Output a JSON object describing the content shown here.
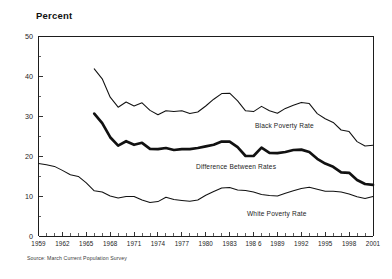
{
  "chart_title": "Percent",
  "source_note": "Source: March Current Population Survey",
  "labels": {
    "black": "Black Poverty Rate",
    "difference": "Difference Between Rates",
    "white": "White Poverty Rate"
  },
  "axis": {
    "y_ticks": [
      "0",
      "10",
      "20",
      "30",
      "40",
      "50"
    ],
    "x_ticks": [
      "1959",
      "1962",
      "1965",
      "1968",
      "1971",
      "1974",
      "1977",
      "1980",
      "198 6",
      "1989",
      "1992",
      "1995",
      "1998",
      "2001"
    ],
    "x_tick_1983": "1983"
  },
  "chart_data": {
    "type": "line",
    "title": "Percent",
    "xlabel": "",
    "ylabel": "Percent",
    "xlim": [
      1959,
      2001
    ],
    "ylim": [
      0,
      50
    ],
    "yticks": [
      0,
      10,
      20,
      30,
      40,
      50
    ],
    "y_minor_tick_step": 5,
    "xticks": [
      1959,
      1962,
      1965,
      1968,
      1971,
      1974,
      1977,
      1980,
      1983,
      1986,
      1989,
      1992,
      1995,
      1998,
      2001
    ],
    "x_minor_tick_step": 1,
    "grid": false,
    "legend": "inline-annotations",
    "note": "Difference Between Rates equals Black Poverty Rate minus White Poverty Rate",
    "x": [
      1959,
      1960,
      1961,
      1962,
      1963,
      1964,
      1965,
      1966,
      1967,
      1968,
      1969,
      1970,
      1971,
      1972,
      1973,
      1974,
      1975,
      1976,
      1977,
      1978,
      1979,
      1980,
      1981,
      1982,
      1983,
      1984,
      1985,
      1986,
      1987,
      1988,
      1989,
      1990,
      1991,
      1992,
      1993,
      1994,
      1995,
      1996,
      1997,
      1998,
      1999,
      2000,
      2001
    ],
    "series": [
      {
        "name": "Black Poverty Rate",
        "style": "thin",
        "color": "#111111",
        "x_start": 1966,
        "values": [
          null,
          null,
          null,
          null,
          null,
          null,
          null,
          41.8,
          39.3,
          34.7,
          32.2,
          33.5,
          32.5,
          33.3,
          31.4,
          30.3,
          31.3,
          31.1,
          31.3,
          30.6,
          31.0,
          32.5,
          34.2,
          35.6,
          35.7,
          33.8,
          31.3,
          31.1,
          32.4,
          31.3,
          30.7,
          31.9,
          32.7,
          33.4,
          33.1,
          30.6,
          29.3,
          28.4,
          26.5,
          26.1,
          23.6,
          22.5,
          22.7
        ]
      },
      {
        "name": "Difference Between Rates",
        "style": "bold",
        "color": "#111111",
        "x_start": 1966,
        "values": [
          null,
          null,
          null,
          null,
          null,
          null,
          null,
          30.6,
          28.2,
          24.7,
          22.6,
          23.7,
          22.8,
          23.3,
          21.8,
          21.7,
          22.0,
          21.5,
          21.7,
          21.7,
          22.0,
          22.4,
          22.8,
          23.6,
          23.6,
          22.2,
          20.0,
          20.0,
          22.1,
          20.8,
          20.7,
          21.0,
          21.5,
          21.6,
          21.0,
          19.3,
          18.1,
          17.3,
          15.9,
          15.8,
          14.0,
          13.0,
          12.8
        ]
      },
      {
        "name": "White Poverty Rate",
        "style": "thin",
        "color": "#111111",
        "x_start": 1959,
        "values": [
          18.1,
          17.8,
          17.4,
          16.4,
          15.3,
          14.9,
          13.3,
          11.3,
          11.0,
          10.0,
          9.5,
          9.9,
          9.9,
          9.0,
          8.4,
          8.6,
          9.7,
          9.1,
          8.9,
          8.7,
          9.0,
          10.2,
          11.1,
          12.0,
          12.1,
          11.5,
          11.4,
          11.0,
          10.4,
          10.1,
          10.0,
          10.7,
          11.3,
          11.9,
          12.2,
          11.7,
          11.2,
          11.2,
          11.0,
          10.5,
          9.8,
          9.4,
          9.9
        ]
      }
    ]
  }
}
